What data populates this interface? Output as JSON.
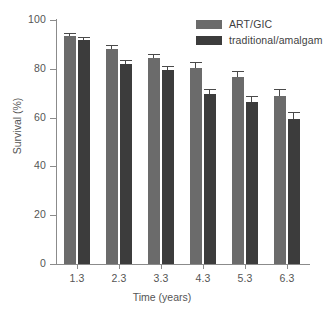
{
  "chart_data": {
    "type": "bar",
    "title": "",
    "xlabel": "Time (years)",
    "ylabel": "Survival (%)",
    "categories": [
      "1.3",
      "2.3",
      "3.3",
      "4.3",
      "5.3",
      "6.3"
    ],
    "ylim": [
      0,
      100
    ],
    "yticks": [
      0,
      20,
      40,
      60,
      80,
      100
    ],
    "ytick_labels": [
      "0",
      "20",
      "40",
      "60",
      "80",
      "100"
    ],
    "grid": false,
    "legend_position": "top-right",
    "error_bars": "upper-only",
    "series": [
      {
        "name": "ART/GIC",
        "color": "#6b6b6b",
        "values": [
          93.5,
          88.0,
          84.5,
          80.5,
          76.5,
          69.0
        ],
        "errors": [
          1.2,
          1.8,
          1.5,
          2.2,
          2.5,
          2.8
        ]
      },
      {
        "name": "traditional/amalgam",
        "color": "#3c3c3c",
        "values": [
          92.0,
          82.0,
          79.5,
          69.5,
          66.5,
          59.5
        ],
        "errors": [
          1.2,
          1.8,
          1.8,
          2.2,
          2.2,
          3.0
        ]
      }
    ]
  },
  "legend": {
    "items": [
      {
        "label": "ART/GIC",
        "color": "#6b6b6b"
      },
      {
        "label": "traditional/amalgam",
        "color": "#3c3c3c"
      }
    ]
  },
  "axes": {
    "x_title": "Time (years)",
    "y_title": "Survival (%)"
  }
}
